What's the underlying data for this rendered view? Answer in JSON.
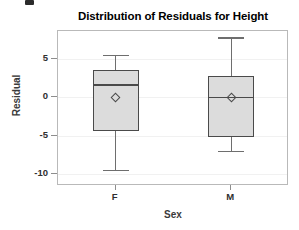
{
  "chart_data": {
    "type": "box",
    "title": "Distribution of Residuals for Height",
    "xlabel": "Sex",
    "ylabel": "Residual",
    "categories": [
      "F",
      "M"
    ],
    "ylim": [
      -11.5,
      8.6
    ],
    "yticks": [
      5,
      0,
      -5,
      -10
    ],
    "ytick_labels": [
      "5",
      "0",
      "-5",
      "-10"
    ],
    "grid": true,
    "legend": "none",
    "series": [
      {
        "name": "F",
        "whisker_low": -9.4,
        "q1": -4.4,
        "median": 1.7,
        "q3": 3.5,
        "whisker_high": 5.5,
        "mean": 0.0
      },
      {
        "name": "M",
        "whisker_low": -6.9,
        "q1": -5.2,
        "median": 0.1,
        "q3": 2.8,
        "whisker_high": 7.8,
        "mean": 0.0
      }
    ],
    "colors": {
      "box_fill": "#dcdcdc",
      "box_border": "#4a4a4a",
      "whisker": "#6e6e6e",
      "frame": "#b9b9b9",
      "grid": "#f1f1f1",
      "text": "#2f2f2f"
    }
  }
}
